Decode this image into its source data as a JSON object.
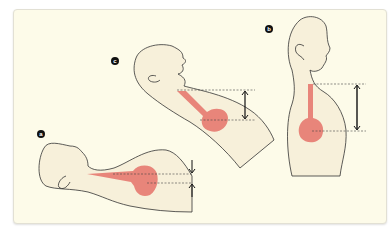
{
  "figure": {
    "panels": [
      {
        "id": "a",
        "label": "a",
        "description": "Supine head, neck extended posteriorly; small vertical distance between dashed lines (downward and upward arrows)"
      },
      {
        "id": "b",
        "label": "b",
        "description": "Upright profile; large vertical distance between dashed lines (double-headed arrow)"
      },
      {
        "id": "c",
        "label": "c",
        "description": "Head tilted back; intermediate vertical distance between dashed lines (double-headed arrow)"
      }
    ],
    "colors": {
      "background": "#fdfbe9",
      "skin_fill": "#f7f0da",
      "outline": "#333333",
      "organ": "#e8857a",
      "dashed_line": "#444444",
      "arrow": "#111111"
    }
  }
}
